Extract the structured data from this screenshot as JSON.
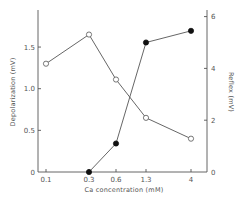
{
  "chart_data": {
    "type": "line",
    "title": "",
    "xlabel": "Ca concentration (mM)",
    "xscale": "log",
    "x_tick_labels": [
      "0.1",
      "0.3",
      "0.6",
      "1.3",
      "4"
    ],
    "x": [
      0.1,
      0.3,
      0.6,
      1.3,
      4
    ],
    "y_left": {
      "label": "Depolarization (mV)",
      "ylim": [
        0,
        1.9
      ],
      "ticks": [
        0,
        0.5,
        1.0,
        1.5
      ],
      "tick_labels": [
        "0",
        "0.5",
        "1.0",
        "1.5"
      ]
    },
    "y_right": {
      "label": "Reflex (mV)",
      "ylim": [
        0,
        6.2
      ],
      "ticks": [
        0,
        2,
        4,
        6
      ],
      "tick_labels": [
        "0",
        "2",
        "4",
        "6"
      ]
    },
    "series": [
      {
        "name": "Depolarization",
        "axis": "left",
        "marker": "open-circle",
        "x": [
          0.1,
          0.3,
          0.6,
          1.3,
          4
        ],
        "values": [
          1.3,
          1.65,
          1.11,
          0.65,
          0.4
        ]
      },
      {
        "name": "Reflex",
        "axis": "right",
        "marker": "filled-circle",
        "x": [
          0.3,
          0.6,
          1.3,
          4
        ],
        "values": [
          0.0,
          1.1,
          5.0,
          5.45
        ]
      }
    ],
    "grid": false,
    "legend": "none"
  },
  "layout": {
    "plot_left": 38,
    "plot_right": 207,
    "plot_top": 10,
    "plot_bottom": 172,
    "x_pixel": {
      "0.1": 46,
      "0.3": 89,
      "0.6": 116,
      "1.3": 146,
      "4": 191
    },
    "left_px_per_unit": 83.3,
    "right_px_per_unit": 25.9
  },
  "colors": {
    "axis": "#555555",
    "filled_marker": "#111111",
    "open_marker_fill": "#ffffff",
    "background": "#ffffff"
  }
}
